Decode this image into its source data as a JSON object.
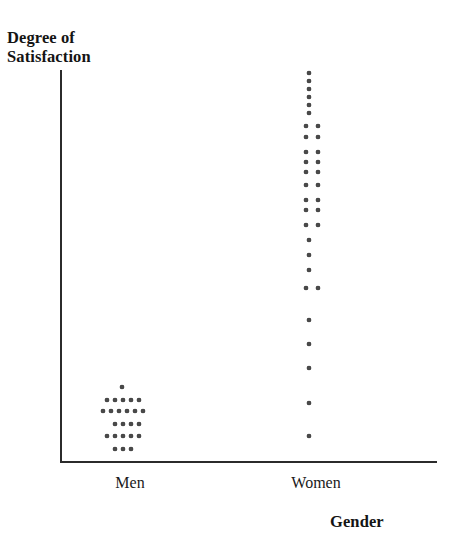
{
  "chart": {
    "ylabel": "Degree of\nSatisfaction",
    "xlabel": "Gender"
  },
  "categories": {
    "men": "Men",
    "women": "Women"
  },
  "chart_data": {
    "type": "scatter",
    "subtype": "dotplot",
    "title": "",
    "xlabel": "Gender",
    "ylabel": "Degree of Satisfaction",
    "grid": false,
    "legend": null,
    "axis_ranges": {
      "x": "categorical",
      "y": "unlabeled ordinal scale, low at bottom to high at top"
    },
    "categories": [
      "Men",
      "Women"
    ],
    "annotations": [
      "Men cluster concentrated at the low end of the satisfaction scale",
      "Women values spread widely across the full satisfaction scale, concentrated at the high end"
    ],
    "series": [
      {
        "name": "Men",
        "category_index": 0,
        "count": 24,
        "stack_rows": [
          {
            "row": 1,
            "y_px": 387,
            "dots": 1
          },
          {
            "row": 2,
            "y_px": 400,
            "dots": 5
          },
          {
            "row": 3,
            "y_px": 410,
            "dots": 6
          },
          {
            "row": 4,
            "y_px": 424,
            "dots": 4
          },
          {
            "row": 5,
            "y_px": 436,
            "dots": 5
          },
          {
            "row": 6,
            "y_px": 449,
            "dots": 3
          }
        ],
        "points": [
          {
            "x_px": 122,
            "y_px": 387
          },
          {
            "x_px": 107,
            "y_px": 400
          },
          {
            "x_px": 115,
            "y_px": 400
          },
          {
            "x_px": 123,
            "y_px": 400
          },
          {
            "x_px": 131,
            "y_px": 400
          },
          {
            "x_px": 139,
            "y_px": 400
          },
          {
            "x_px": 103,
            "y_px": 411
          },
          {
            "x_px": 111,
            "y_px": 411
          },
          {
            "x_px": 119,
            "y_px": 411
          },
          {
            "x_px": 127,
            "y_px": 411
          },
          {
            "x_px": 135,
            "y_px": 411
          },
          {
            "x_px": 143,
            "y_px": 411
          },
          {
            "x_px": 115,
            "y_px": 424
          },
          {
            "x_px": 123,
            "y_px": 424
          },
          {
            "x_px": 131,
            "y_px": 424
          },
          {
            "x_px": 139,
            "y_px": 424
          },
          {
            "x_px": 107,
            "y_px": 436
          },
          {
            "x_px": 115,
            "y_px": 436
          },
          {
            "x_px": 123,
            "y_px": 436
          },
          {
            "x_px": 131,
            "y_px": 436
          },
          {
            "x_px": 139,
            "y_px": 436
          },
          {
            "x_px": 115,
            "y_px": 449
          },
          {
            "x_px": 123,
            "y_px": 449
          },
          {
            "x_px": 131,
            "y_px": 449
          }
        ]
      },
      {
        "name": "Women",
        "category_index": 1,
        "count": 36,
        "stack_rows": [
          {
            "row": 1,
            "y_px": 73,
            "dots": 1
          },
          {
            "row": 2,
            "y_px": 81,
            "dots": 1
          },
          {
            "row": 3,
            "y_px": 89,
            "dots": 1
          },
          {
            "row": 4,
            "y_px": 97,
            "dots": 1
          },
          {
            "row": 5,
            "y_px": 105,
            "dots": 1
          },
          {
            "row": 6,
            "y_px": 113,
            "dots": 1
          },
          {
            "row": 7,
            "y_px": 126,
            "dots": 2
          },
          {
            "row": 8,
            "y_px": 137,
            "dots": 2
          },
          {
            "row": 9,
            "y_px": 152,
            "dots": 2
          },
          {
            "row": 10,
            "y_px": 162,
            "dots": 2
          },
          {
            "row": 11,
            "y_px": 172,
            "dots": 2
          },
          {
            "row": 12,
            "y_px": 185,
            "dots": 2
          },
          {
            "row": 13,
            "y_px": 200,
            "dots": 2
          },
          {
            "row": 14,
            "y_px": 210,
            "dots": 2
          },
          {
            "row": 15,
            "y_px": 225,
            "dots": 2
          },
          {
            "row": 16,
            "y_px": 240,
            "dots": 1
          },
          {
            "row": 17,
            "y_px": 255,
            "dots": 1
          },
          {
            "row": 18,
            "y_px": 270,
            "dots": 1
          },
          {
            "row": 19,
            "y_px": 288,
            "dots": 2
          },
          {
            "row": 20,
            "y_px": 320,
            "dots": 1
          },
          {
            "row": 21,
            "y_px": 344,
            "dots": 1
          },
          {
            "row": 22,
            "y_px": 368,
            "dots": 1
          },
          {
            "row": 23,
            "y_px": 403,
            "dots": 1
          },
          {
            "row": 24,
            "y_px": 436,
            "dots": 1
          }
        ],
        "points": [
          {
            "x_px": 309,
            "y_px": 73
          },
          {
            "x_px": 309,
            "y_px": 81
          },
          {
            "x_px": 309,
            "y_px": 89
          },
          {
            "x_px": 309,
            "y_px": 97
          },
          {
            "x_px": 309,
            "y_px": 105
          },
          {
            "x_px": 309,
            "y_px": 113
          },
          {
            "x_px": 306,
            "y_px": 126
          },
          {
            "x_px": 318,
            "y_px": 126
          },
          {
            "x_px": 306,
            "y_px": 137
          },
          {
            "x_px": 318,
            "y_px": 137
          },
          {
            "x_px": 306,
            "y_px": 152
          },
          {
            "x_px": 318,
            "y_px": 152
          },
          {
            "x_px": 306,
            "y_px": 162
          },
          {
            "x_px": 318,
            "y_px": 162
          },
          {
            "x_px": 306,
            "y_px": 172
          },
          {
            "x_px": 318,
            "y_px": 172
          },
          {
            "x_px": 306,
            "y_px": 185
          },
          {
            "x_px": 318,
            "y_px": 185
          },
          {
            "x_px": 306,
            "y_px": 200
          },
          {
            "x_px": 318,
            "y_px": 200
          },
          {
            "x_px": 306,
            "y_px": 210
          },
          {
            "x_px": 318,
            "y_px": 210
          },
          {
            "x_px": 306,
            "y_px": 225
          },
          {
            "x_px": 318,
            "y_px": 225
          },
          {
            "x_px": 309,
            "y_px": 240
          },
          {
            "x_px": 309,
            "y_px": 255
          },
          {
            "x_px": 309,
            "y_px": 270
          },
          {
            "x_px": 306,
            "y_px": 288
          },
          {
            "x_px": 318,
            "y_px": 288
          },
          {
            "x_px": 309,
            "y_px": 320
          },
          {
            "x_px": 309,
            "y_px": 344
          },
          {
            "x_px": 309,
            "y_px": 368
          },
          {
            "x_px": 309,
            "y_px": 403
          },
          {
            "x_px": 309,
            "y_px": 436
          }
        ]
      }
    ],
    "colors": {
      "dot": "#4a4a4a",
      "axis": "#2b2b2b",
      "text": "#1a1a1a",
      "background": "#ffffff"
    }
  }
}
